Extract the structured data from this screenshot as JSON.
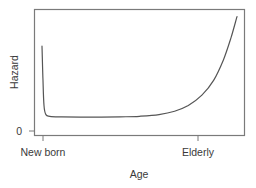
{
  "chart_data": {
    "type": "line",
    "title": "",
    "xlabel": "Age",
    "ylabel": "Hazard",
    "x_ticks": [
      "New born",
      "Elderly"
    ],
    "y_ticks": [
      "0"
    ],
    "grid": false,
    "legend": null,
    "series": [
      {
        "name": "Hazard (bathtub curve)",
        "shape": "bathtub",
        "description": "High hazard at birth drops sharply, stays low and flat through mid-life, then rises exponentially toward old age",
        "points_norm": [
          [
            0.0,
            0.7
          ],
          [
            0.005,
            0.4
          ],
          [
            0.01,
            0.18
          ],
          [
            0.02,
            0.1
          ],
          [
            0.04,
            0.085
          ],
          [
            0.1,
            0.08
          ],
          [
            0.25,
            0.078
          ],
          [
            0.4,
            0.08
          ],
          [
            0.5,
            0.085
          ],
          [
            0.6,
            0.1
          ],
          [
            0.68,
            0.13
          ],
          [
            0.75,
            0.18
          ],
          [
            0.82,
            0.27
          ],
          [
            0.88,
            0.4
          ],
          [
            0.93,
            0.58
          ],
          [
            0.97,
            0.78
          ],
          [
            1.0,
            0.96
          ]
        ]
      }
    ],
    "xlim": [
      0,
      1
    ],
    "ylim": [
      0,
      1
    ]
  },
  "colors": {
    "axis": "#7a7a7a",
    "line": "#555555",
    "text": "#3a3a3a"
  }
}
